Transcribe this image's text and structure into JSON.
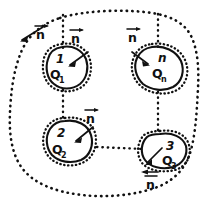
{
  "figure": {
    "type": "hand-drawn-physics-diagram",
    "background_color": "#ffffff",
    "ink_color": "#111111",
    "canvas": {
      "width": 211,
      "height": 209
    }
  },
  "outer_surface": {
    "name": "outer-enclosing-surface",
    "style": "dotted",
    "normal_label": "n",
    "normal_label_has_vector_arrow": true
  },
  "regions": [
    {
      "id": "region-1",
      "index_label": "1",
      "charge_label": "Q",
      "charge_subscript": "1",
      "normal_label": "n",
      "normal_arrow_direction": "inward-from-upper-right"
    },
    {
      "id": "region-n",
      "index_label": "n",
      "charge_label": "Q",
      "charge_subscript": "n",
      "normal_label": "n",
      "normal_arrow_direction": "inward-from-upper-left"
    },
    {
      "id": "region-2",
      "index_label": "2",
      "charge_label": "Q",
      "charge_subscript": "2",
      "normal_label": "n",
      "normal_arrow_direction": "inward-from-upper-right"
    },
    {
      "id": "region-3",
      "index_label": "3",
      "charge_label": "Q",
      "charge_subscript": "3",
      "normal_label": "n",
      "normal_arrow_direction": "inward-from-lower-left"
    }
  ],
  "normal_vector_labels": [
    {
      "id": "n-outer-topleft",
      "text": "n",
      "has_arrow": true
    },
    {
      "id": "n-region1",
      "text": "n",
      "has_arrow": true
    },
    {
      "id": "n-regionn",
      "text": "n",
      "has_arrow": true
    },
    {
      "id": "n-region2",
      "text": "n",
      "has_arrow": true
    },
    {
      "id": "n-region3",
      "text": "n",
      "has_arrow": true
    },
    {
      "id": "n-inside-regionn",
      "text": "n",
      "has_arrow": false
    }
  ],
  "connectors": [
    {
      "id": "link-top-to-region1",
      "style": "dotted"
    },
    {
      "id": "link-top-to-regionn",
      "style": "dotted"
    },
    {
      "id": "link-region1-to-region2",
      "style": "dotted"
    },
    {
      "id": "link-regionn-to-region3",
      "style": "dotted"
    },
    {
      "id": "link-region2-to-region3",
      "style": "dotted"
    }
  ]
}
